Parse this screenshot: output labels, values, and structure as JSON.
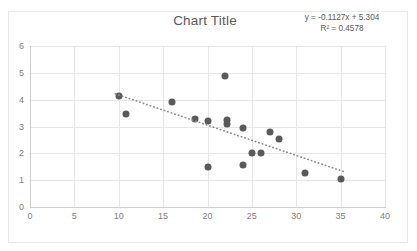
{
  "chart": {
    "title": "Chart Title",
    "equation": "y = -0.1127x + 5.304",
    "r_squared": "R² = 0.4578"
  },
  "chart_data": {
    "type": "scatter",
    "title": "Chart Title",
    "xlabel": "",
    "ylabel": "",
    "xlim": [
      0,
      40
    ],
    "ylim": [
      0,
      6
    ],
    "xticks": [
      0,
      5,
      10,
      15,
      20,
      25,
      30,
      35,
      40
    ],
    "yticks": [
      0,
      1,
      2,
      3,
      4,
      5,
      6
    ],
    "grid": true,
    "legend": false,
    "marker_color": "#5a5a5a",
    "trendline": {
      "type": "linear",
      "style": "dotted",
      "color": "#8c8c8c",
      "slope": -0.1127,
      "intercept": 5.304,
      "equation": "y = -0.1127x + 5.304",
      "r_squared": 0.4578,
      "x_start": 9.6,
      "x_end": 35.4
    },
    "points": [
      {
        "x": 10.0,
        "y": 4.15
      },
      {
        "x": 10.8,
        "y": 3.45
      },
      {
        "x": 16.0,
        "y": 3.93
      },
      {
        "x": 18.6,
        "y": 3.28
      },
      {
        "x": 20.0,
        "y": 3.22
      },
      {
        "x": 20.0,
        "y": 1.48
      },
      {
        "x": 22.0,
        "y": 4.88
      },
      {
        "x": 22.2,
        "y": 3.25
      },
      {
        "x": 22.2,
        "y": 3.08
      },
      {
        "x": 24.0,
        "y": 2.93
      },
      {
        "x": 24.0,
        "y": 1.55
      },
      {
        "x": 25.0,
        "y": 2.0
      },
      {
        "x": 26.0,
        "y": 2.02
      },
      {
        "x": 27.0,
        "y": 2.78
      },
      {
        "x": 28.0,
        "y": 2.52
      },
      {
        "x": 31.0,
        "y": 1.27
      },
      {
        "x": 35.0,
        "y": 1.03
      }
    ]
  }
}
